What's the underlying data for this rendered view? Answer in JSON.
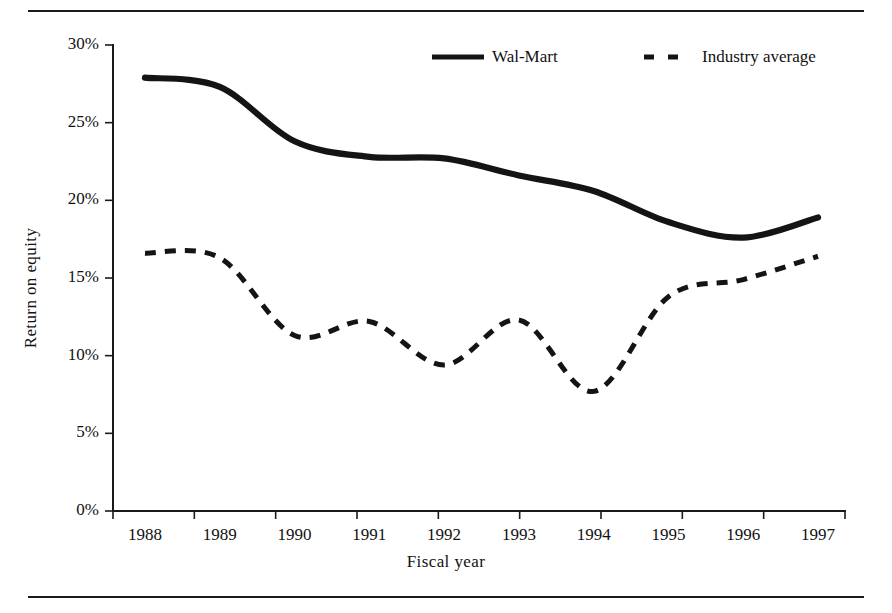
{
  "figure": {
    "top_rule": "",
    "bottom_rule": ""
  },
  "chart_data": {
    "type": "line",
    "title": "",
    "xlabel": "Fiscal year",
    "ylabel": "Return on equity",
    "xlim": [
      1988,
      1997
    ],
    "ylim": [
      0,
      30
    ],
    "grid": false,
    "legend_position": "top-right",
    "y_tick_labels": [
      "30%",
      "25%",
      "20%",
      "15%",
      "10%",
      "5%",
      "0%"
    ],
    "y_ticks": [
      30,
      25,
      20,
      15,
      10,
      5,
      0
    ],
    "x_tick_labels": [
      "1988",
      "1989",
      "1990",
      "1991",
      "1992",
      "1993",
      "1994",
      "1995",
      "1996",
      "1997"
    ],
    "categories": [
      1988,
      1989,
      1990,
      1991,
      1992,
      1993,
      1994,
      1995,
      1996,
      1997
    ],
    "series": [
      {
        "name": "Wal-Mart",
        "style": "solid",
        "color": "#141414",
        "values": [
          27.9,
          27.3,
          23.8,
          22.8,
          22.7,
          21.6,
          20.6,
          18.6,
          17.6,
          18.9
        ]
      },
      {
        "name": "Industry average",
        "style": "dashed",
        "color": "#141414",
        "values": [
          16.6,
          16.3,
          11.3,
          12.2,
          9.4,
          12.3,
          7.7,
          13.8,
          14.9,
          16.4
        ]
      }
    ]
  },
  "legend": {
    "entries": [
      {
        "label": "Wal-Mart",
        "style": "solid"
      },
      {
        "label": "Industry average",
        "style": "dashed"
      }
    ]
  }
}
